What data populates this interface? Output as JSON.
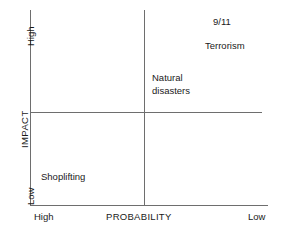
{
  "chart_data": {
    "type": "scatter",
    "title": "",
    "xlabel": "PROBABILITY",
    "ylabel": "IMPACT",
    "x_ticks": [
      "High",
      "Low"
    ],
    "y_ticks": [
      "High",
      "Low"
    ],
    "grid": false,
    "legend": "none",
    "note": "2x2 risk matrix; x-axis runs High (left) to Low (right), y-axis runs Low (bottom) to High (top)",
    "quadrant_divider_x": "mid",
    "quadrant_divider_y": "mid",
    "points": [
      {
        "label": "9/11",
        "probability": "Low",
        "impact": "High",
        "quadrant": "top-right"
      },
      {
        "label": "Terrorism",
        "probability": "Low",
        "impact": "High",
        "quadrant": "top-right"
      },
      {
        "label": "Natural disasters",
        "probability": "Moderate",
        "impact": "Moderate",
        "quadrant": "top-right"
      },
      {
        "label": "Shoplifting",
        "probability": "High",
        "impact": "Low",
        "quadrant": "bottom-left"
      }
    ]
  },
  "axes": {
    "y": {
      "title": "IMPACT",
      "top_label": "High",
      "bottom_label": "Low"
    },
    "x": {
      "title": "PROBABILITY",
      "left_label": "High",
      "right_label": "Low"
    }
  },
  "items": {
    "nine_eleven": "9/11",
    "terrorism": "Terrorism",
    "natural_disasters": "Natural\ndisasters",
    "shoplifting": "Shoplifting"
  },
  "colors": {
    "line": "#6e6e6e",
    "text": "#1a1a1a",
    "background": "#ffffff"
  }
}
